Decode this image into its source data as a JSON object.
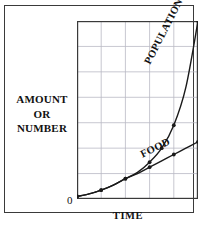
{
  "figure": {
    "y_axis_caption_lines": [
      "AMOUNT",
      "OR",
      "NUMBER"
    ],
    "origin_label": "0",
    "x_axis_title": "TIME",
    "series_labels": {
      "population": "POPULATION",
      "food": "FOOD"
    },
    "colors": {
      "ink": "#111111",
      "frame": "#3a3a3a",
      "grid": "#b9b9c4",
      "curve": "#1a1a1a",
      "background": "#ffffff"
    }
  },
  "chart_data": {
    "type": "line",
    "title": "",
    "subtitle": "",
    "xlabel": "TIME",
    "ylabel": "AMOUNT OR NUMBER",
    "xlim": [
      0,
      5
    ],
    "ylim": [
      0,
      7
    ],
    "grid": true,
    "axis_ticks_labeled": false,
    "legend": "inline-curve-labels",
    "annotations": [
      "POPULATION",
      "FOOD",
      "0"
    ],
    "x": [
      0,
      0.5,
      1.0,
      1.5,
      2.0,
      2.5,
      3.0,
      3.5,
      4.0,
      4.5,
      5.0
    ],
    "series": [
      {
        "name": "POPULATION",
        "label_rotation_deg": -63,
        "markers": true,
        "values": [
          0.1,
          0.2,
          0.35,
          0.55,
          0.8,
          1.05,
          1.45,
          2.0,
          2.9,
          4.4,
          7.0
        ]
      },
      {
        "name": "FOOD",
        "label_rotation_deg": -26,
        "markers": true,
        "values": [
          0.1,
          0.2,
          0.35,
          0.55,
          0.8,
          1.0,
          1.25,
          1.5,
          1.75,
          2.0,
          2.25
        ]
      }
    ],
    "marker_points": {
      "POPULATION": [
        [
          0,
          0.1
        ],
        [
          1.0,
          0.35
        ],
        [
          2.0,
          0.8
        ],
        [
          3.0,
          1.45
        ],
        [
          3.5,
          2.0
        ],
        [
          4.0,
          2.9
        ],
        [
          5.0,
          7.0
        ]
      ],
      "FOOD": [
        [
          0,
          0.1
        ],
        [
          1.0,
          0.35
        ],
        [
          2.0,
          0.8
        ],
        [
          3.0,
          1.25
        ],
        [
          4.0,
          1.75
        ],
        [
          5.0,
          2.25
        ]
      ]
    }
  }
}
